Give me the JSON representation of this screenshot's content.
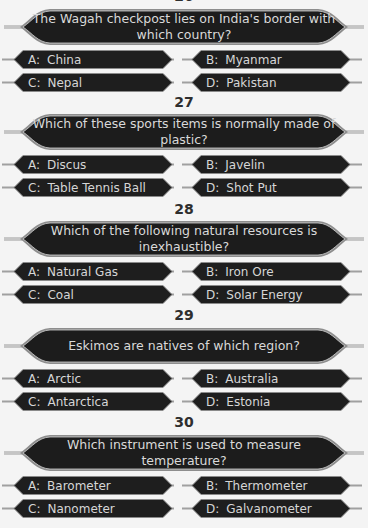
{
  "questions": [
    {
      "number": "26",
      "text": "The Wagah checkpost lies on India's border with which country?",
      "options": [
        {
          "letter": "A:",
          "text": "China"
        },
        {
          "letter": "B:",
          "text": "Myanmar"
        },
        {
          "letter": "C:",
          "text": "Nepal"
        },
        {
          "letter": "D:",
          "text": "Pakistan"
        }
      ]
    },
    {
      "number": "27",
      "text": "Which of these sports items is normally made of plastic?",
      "options": [
        {
          "letter": "A:",
          "text": "Discus"
        },
        {
          "letter": "B:",
          "text": "Javelin"
        },
        {
          "letter": "C:",
          "text": "Table Tennis Ball"
        },
        {
          "letter": "D:",
          "text": "Shot Put"
        }
      ]
    },
    {
      "number": "28",
      "text": "Which of the following natural resources is inexhaustible?",
      "options": [
        {
          "letter": "A:",
          "text": "Natural Gas"
        },
        {
          "letter": "B:",
          "text": "Iron Ore"
        },
        {
          "letter": "C:",
          "text": "Coal"
        },
        {
          "letter": "D:",
          "text": "Solar Energy"
        }
      ]
    },
    {
      "number": "29",
      "text": "Eskimos are natives of which region?",
      "options": [
        {
          "letter": "A:",
          "text": "Arctic"
        },
        {
          "letter": "B:",
          "text": "Australia"
        },
        {
          "letter": "C:",
          "text": "Antarctica"
        },
        {
          "letter": "D:",
          "text": "Estonia"
        }
      ]
    },
    {
      "number": "30",
      "text": "Which instrument is used to measure temperature?",
      "options": [
        {
          "letter": "A:",
          "text": "Barometer"
        },
        {
          "letter": "B:",
          "text": "Thermometer"
        },
        {
          "letter": "C:",
          "text": "Nanometer"
        },
        {
          "letter": "D:",
          "text": "Galvanometer"
        }
      ]
    }
  ],
  "colors": {
    "background": "#f4f4f4",
    "panel_fill": "#1c1c1c",
    "panel_border": "#b8b8b8",
    "panel_text": "#d9d9d9",
    "number_text": "#2e2e2e"
  }
}
